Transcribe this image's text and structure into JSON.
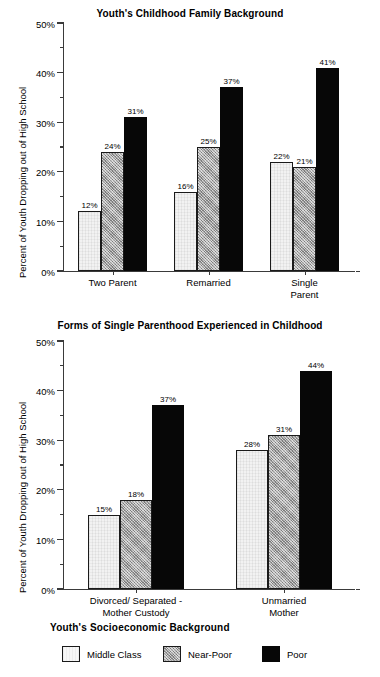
{
  "page": {
    "background": "#ffffff",
    "ink": "#000000"
  },
  "legend": {
    "title": "Youth's  Socioeconomic Background",
    "items": [
      {
        "label": "Middle Class",
        "key": "middle",
        "color": "#f2f2f2"
      },
      {
        "label": "Near-Poor",
        "key": "nearpoor",
        "color": "#a8a8a8"
      },
      {
        "label": "Poor",
        "key": "poor",
        "color": "#070707"
      }
    ]
  },
  "chart_data": [
    {
      "id": "top",
      "type": "bar",
      "title": "Youth's Childhood Family Background",
      "xlabel": "",
      "ylabel": "Percent of Youth Dropping out of High School",
      "ylim": [
        0,
        50
      ],
      "yticks": [
        0,
        10,
        20,
        30,
        40,
        50
      ],
      "yticklabels": [
        "0%",
        "10%",
        "20%",
        "30%",
        "40%",
        "50%"
      ],
      "minor_yticks": [
        5,
        15,
        25,
        35,
        45
      ],
      "grid": false,
      "legend_position": "bottom-shared",
      "categories": [
        "Two Parent",
        "Remarried",
        "Single Parent"
      ],
      "series": [
        {
          "name": "Middle Class",
          "values": [
            12,
            16,
            22
          ],
          "labels": [
            "12%",
            "16%",
            "22%"
          ]
        },
        {
          "name": "Near-Poor",
          "values": [
            24,
            25,
            21
          ],
          "labels": [
            "24%",
            "25%",
            "21%"
          ]
        },
        {
          "name": "Poor",
          "values": [
            31,
            37,
            41
          ],
          "labels": [
            "31%",
            "37%",
            "41%"
          ]
        }
      ]
    },
    {
      "id": "bottom",
      "type": "bar",
      "title": "Forms of Single Parenthood Experienced in Childhood",
      "xlabel": "",
      "ylabel": "Percent of Youth Dropping out of High School",
      "ylim": [
        0,
        50
      ],
      "yticks": [
        0,
        10,
        20,
        30,
        40,
        50
      ],
      "yticklabels": [
        "0%",
        "10%",
        "20%",
        "30%",
        "40%",
        "50%"
      ],
      "minor_yticks": [
        5,
        15,
        25,
        35,
        45
      ],
      "grid": false,
      "legend_position": "bottom-shared",
      "categories": [
        "Divorced/ Separated -\nMother Custody",
        "Unmarried\nMother"
      ],
      "series": [
        {
          "name": "Middle Class",
          "values": [
            15,
            28
          ],
          "labels": [
            "15%",
            "28%"
          ]
        },
        {
          "name": "Near-Poor",
          "values": [
            18,
            31
          ],
          "labels": [
            "18%",
            "31%"
          ]
        },
        {
          "name": "Poor",
          "values": [
            37,
            44
          ],
          "labels": [
            "37%",
            "44%"
          ]
        }
      ]
    }
  ]
}
